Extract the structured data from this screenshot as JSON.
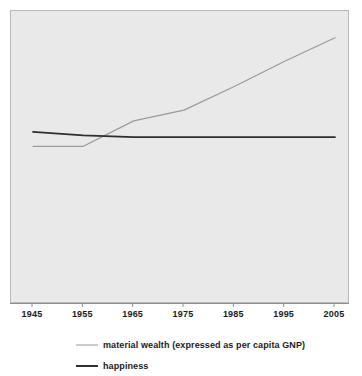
{
  "chart_data": {
    "type": "line",
    "title": "",
    "subtitle": "",
    "xlabel": "",
    "ylabel": "",
    "grid": false,
    "legend_position": "bottom",
    "xlim": [
      1945,
      2005
    ],
    "ylim": [
      0,
      100
    ],
    "categories": [
      "1945",
      "1955",
      "1965",
      "1975",
      "1985",
      "1995",
      "2005"
    ],
    "x": [
      1945,
      1955,
      1965,
      1975,
      1985,
      1995,
      2005
    ],
    "axis": {
      "x_ticks": [
        "1945",
        "1955",
        "1965",
        "1975",
        "1985",
        "1995",
        "2005"
      ],
      "y_ticks": []
    },
    "series": [
      {
        "name": "material wealth (expressed as per capita GNP)",
        "key": "material_wealth",
        "color": "#9a9a9a",
        "width": 1,
        "values": [
          33,
          33,
          47,
          53,
          66,
          80,
          93
        ]
      },
      {
        "name": "happiness",
        "key": "happiness",
        "color": "#2e2e2e",
        "width": 2,
        "values": [
          41,
          39,
          38,
          38,
          38,
          38,
          38
        ]
      }
    ],
    "annotations": []
  },
  "legend": {
    "items": [
      {
        "label": "material wealth (expressed as per capita GNP)",
        "swatch": "line-light-gray"
      },
      {
        "label": "happiness",
        "swatch": "line-dark"
      }
    ]
  },
  "colors": {
    "plot_background": "#e9e9e9",
    "plot_border": "#b9b9b9",
    "page_background": "#ffffff",
    "material_wealth_line": "#9a9a9a",
    "happiness_line": "#2e2e2e",
    "tick_label": "#1b1b1b",
    "axis_line": "#8f8f8f"
  }
}
